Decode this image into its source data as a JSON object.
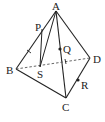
{
  "diagram": {
    "type": "tetrahedron",
    "labels": {
      "A": "A",
      "B": "B",
      "C": "C",
      "D": "D",
      "P": "P",
      "Q": "Q",
      "R": "R",
      "S": "S"
    },
    "points": {
      "A": [
        56,
        11
      ],
      "B": [
        16,
        69
      ],
      "C": [
        66,
        98
      ],
      "D": [
        90,
        58
      ],
      "P": [
        42,
        29
      ],
      "S": [
        40,
        67
      ],
      "Q": [
        60,
        49
      ],
      "R": [
        78,
        80
      ]
    },
    "solid_edges": [
      "AB",
      "AC",
      "AD",
      "BC",
      "CD"
    ],
    "dashed_edges": [
      "BD"
    ],
    "extra_segments": [
      "PS",
      "AS"
    ],
    "marked_points": [
      "Q",
      "R"
    ],
    "tick_marks": [
      "AB",
      "BD"
    ],
    "colors": {
      "stroke": "#222222",
      "background": "#ffffff"
    }
  }
}
